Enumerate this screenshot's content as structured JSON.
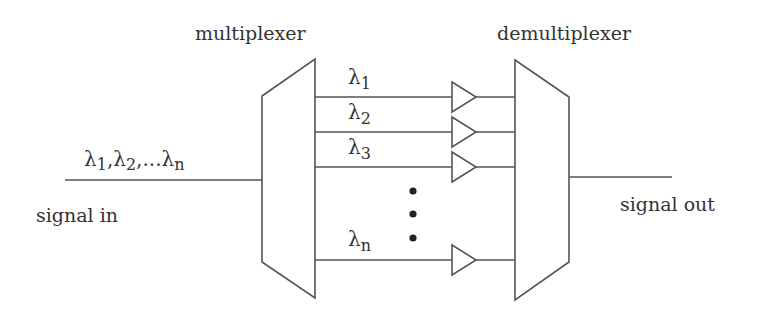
{
  "diagram": {
    "type": "wdm-system",
    "labels": {
      "multiplexer": "multiplexer",
      "demultiplexer": "demultiplexer",
      "signal_in": "signal in",
      "signal_out": "signal out"
    },
    "input_wavelengths": {
      "lambda": "λ",
      "s1": "1",
      "comma1": ",",
      "s2": "2",
      "ellipsis": ",...",
      "sn": "n"
    },
    "channels": [
      {
        "lambda": "λ",
        "sub": "1",
        "y": 97
      },
      {
        "lambda": "λ",
        "sub": "2",
        "y": 132
      },
      {
        "lambda": "λ",
        "sub": "3",
        "y": 167
      },
      {
        "lambda": "λ",
        "sub": "n",
        "y": 260
      }
    ],
    "line_color": "#555555",
    "text_color": "#333333",
    "dot_color": "#222222"
  }
}
